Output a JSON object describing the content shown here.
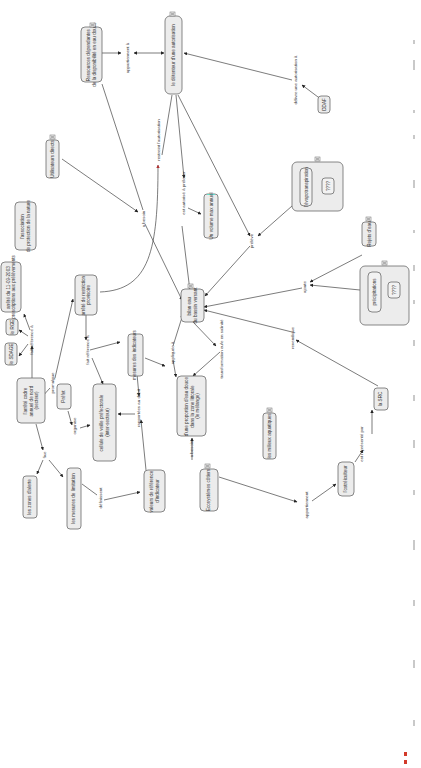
{
  "colors": {
    "node_fill": "#ececec",
    "node_border": "#6b6b6b",
    "edge": "#444444",
    "restrict_arrow_head": "#b03030",
    "highlight_border": "#66ddcc",
    "caption_mark": "#d23a2a"
  },
  "nodes": {
    "ressources": "Ressources dépendantes\nde la disponibilité en eau douce",
    "detenteur": "le détenteur d'une autorisation",
    "ddaf": "DDAF",
    "utilisateurs": "Utilisateurs directs",
    "association": "l'association\nde protection de la nature",
    "arrete_2003": "arrêté du 11-09-2003\nprescriptions aux prélèvements",
    "arrete_restriction": "arrêté de restriction\nprovisoire",
    "volume_max": "Un volume max annuel",
    "evapotranspiration": "l'évapotranspiration",
    "evapo_value": "????",
    "rejets": "Rejets d'eau",
    "precipitations": "précipitations",
    "precip_value": "????",
    "bilan": "bilan eau\ndu bassin versant",
    "rge": "le RGE",
    "sdage": "le SDAGE",
    "arrete_cadre": "l'arrêté cadre\nannuel de nord\n(secteur)",
    "prefet": "Préfet",
    "cellule": "cellule de veille préfectorale\n(inter-secteur)",
    "mesures": "mesures des indicateurs",
    "proportion": "d'une proportion d'eau douce\ndans la zone littorale\n(le mélange)",
    "milieux": "les milieux aquatiques",
    "zones_alerte": "les zones d'alerte",
    "mesures_limitation": "les mesures de limitation",
    "valeurs_reference": "valeurs de référence\nd'indicateur",
    "ecosystemes": "Ecosystèmes côtiers",
    "estrelicultur": "l'ostréiculteur",
    "src": "la SRC"
  },
  "links": {
    "appartiennent_a": "appartiennent à",
    "delivre_autorisation": "délivre une autorisation à",
    "a_besoin_1": "a besoin",
    "restreint": "restreint l'autorisation",
    "est_autorise": "est autorisé à prélever",
    "preleve": "prélève",
    "ajoute": "ajoute",
    "fait_reference_1": "fait référence à",
    "fait_reference_2": "fait référence à",
    "promulgue": "promulgue",
    "organise": "organise",
    "appliquee_a": "appliquée à",
    "transformation": "transformation eu/e en salinité",
    "rapportees": "rapportées au débit",
    "fixe": "fixe",
    "definissent": "définissent",
    "a_besoin_2": "a besoin",
    "appartiennent": "appartiennent",
    "est_represente": "est représenté par",
    "revendique": "revendique"
  },
  "expander_glyph": "collapse-expand-icon"
}
